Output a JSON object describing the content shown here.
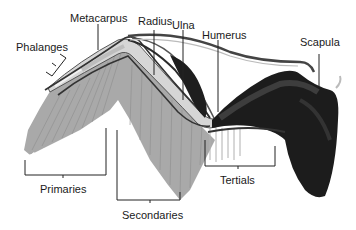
{
  "diagram": {
    "labels": {
      "metacarpus": "Metacarpus",
      "radius": "Radius",
      "ulna": "Ulna",
      "humerus": "Humerus",
      "scapula": "Scapula",
      "phalanges": "Phalanges",
      "primaries": "Primaries",
      "secondaries": "Secondaries",
      "tertials": "Tertials"
    },
    "colors": {
      "feather": "#a8a8a8",
      "feather_dark": "#8e8e8e",
      "bone_light": "#d8d8d8",
      "outline": "#333333",
      "muscle": "#1c1c1c",
      "muscle_mid": "#3a3a3a",
      "leader": "#222222"
    }
  }
}
